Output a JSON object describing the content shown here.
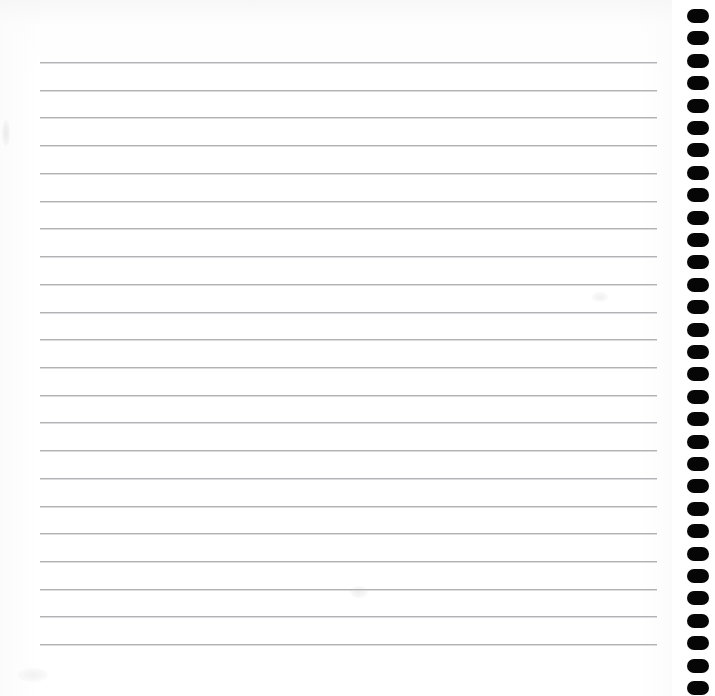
{
  "page": {
    "width": 715,
    "height": 696,
    "background_color": "#ffffff",
    "paper_color": "#ffffff",
    "content_text": ""
  },
  "paper": {
    "name": "paper-sheet",
    "left": 0,
    "top": 0,
    "width": 672,
    "height": 696,
    "tint_color": "#f7f7f8"
  },
  "rules": {
    "name": "ruled-lines",
    "count": 22,
    "color": "#b2b2b4",
    "thickness": 1,
    "left": 40,
    "right": 657,
    "line_width": 617,
    "first_line_y": 62,
    "spacing": 27.7,
    "y_positions": [
      62,
      89.7,
      117.4,
      145.2,
      172.9,
      200.6,
      228.3,
      256,
      283.8,
      311.5,
      339.2,
      366.9,
      394.6,
      422.4,
      450.1,
      477.8,
      505.5,
      533.2,
      561,
      588.7,
      616.4,
      644.1
    ]
  },
  "holes": {
    "name": "punch-hole-column",
    "count": 31,
    "color": "#060606",
    "shape": "rounded-oval",
    "hole_width": 22,
    "hole_height": 14,
    "corner_radius": 7,
    "center_x": 698,
    "first_center_y": 16,
    "spacing": 22.4,
    "column_left": 672,
    "column_width": 43,
    "y_positions": [
      16,
      38.4,
      60.8,
      83.2,
      105.6,
      128,
      150.4,
      172.8,
      195.2,
      217.6,
      240,
      262.4,
      284.8,
      307.2,
      329.6,
      352,
      374.4,
      396.8,
      419.2,
      441.6,
      464,
      486.4,
      508.8,
      531.2,
      553.6,
      576,
      598.4,
      620.8,
      643.2,
      665.6,
      688
    ]
  },
  "smudges": {
    "name": "paper-smudges",
    "count": 4,
    "color": "#e8e8ea"
  }
}
